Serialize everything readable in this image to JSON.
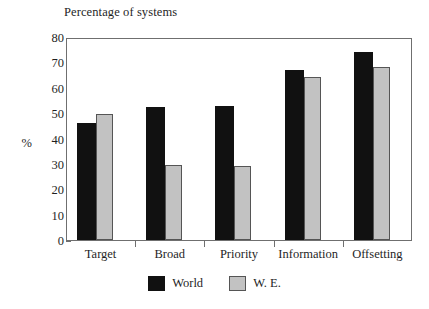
{
  "chart_data": {
    "type": "bar",
    "title": "Percentage of systems",
    "xlabel": "",
    "ylabel": "%",
    "ylim": [
      0,
      80
    ],
    "ytick_step": 10,
    "yticks": [
      80,
      70,
      60,
      50,
      40,
      30,
      20,
      10,
      0
    ],
    "grid": false,
    "legend_position": "bottom-center",
    "categories": [
      "Target",
      "Broad",
      "Priority",
      "Information",
      "Offsetting"
    ],
    "series": [
      {
        "name": "World",
        "color": "#111111",
        "values": [
          46,
          52.5,
          52.8,
          67,
          74
        ]
      },
      {
        "name": "W. E.",
        "color": "#c2c2c2",
        "values": [
          49.7,
          29.6,
          29.2,
          64.3,
          68
        ]
      }
    ]
  },
  "axes": {
    "y_label": "%",
    "frame_color": "#6f6f6f"
  },
  "legend": {
    "entries": [
      {
        "label": "World",
        "swatch": "black-square-swatch"
      },
      {
        "label": "W. E.",
        "swatch": "gray-square-swatch"
      }
    ]
  }
}
